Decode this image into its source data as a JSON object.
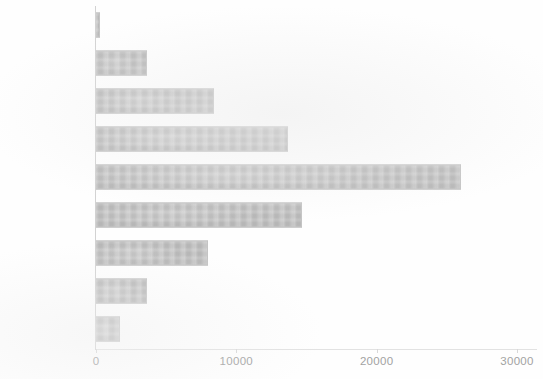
{
  "chart_data": {
    "type": "bar",
    "orientation": "horizontal",
    "title": "",
    "subtitle": "",
    "xlabel": "",
    "ylabel": "",
    "categories": [
      "15-17",
      "18-20",
      "21-24",
      "25-29",
      "30-39",
      "40-49",
      "50-59",
      "60-69",
      "70 and over"
    ],
    "values": [
      250,
      3600,
      8400,
      13700,
      26000,
      14700,
      8000,
      3600,
      1700
    ],
    "series": [
      {
        "name": "Count",
        "values": [
          250,
          3600,
          8400,
          13700,
          26000,
          14700,
          8000,
          3600,
          1700
        ]
      }
    ],
    "xlim": [
      0,
      30000
    ],
    "xticks": [
      0,
      10000,
      20000,
      30000
    ],
    "xtick_labels": [
      "0",
      "10000",
      "20000",
      "30000"
    ],
    "grid": false,
    "legend": false,
    "legend_position": "none",
    "bar_color": "#b6b6b6",
    "text_color": "#9b9b9b",
    "axis_color": "#d2d2d2",
    "background_color": "#ffffff"
  }
}
